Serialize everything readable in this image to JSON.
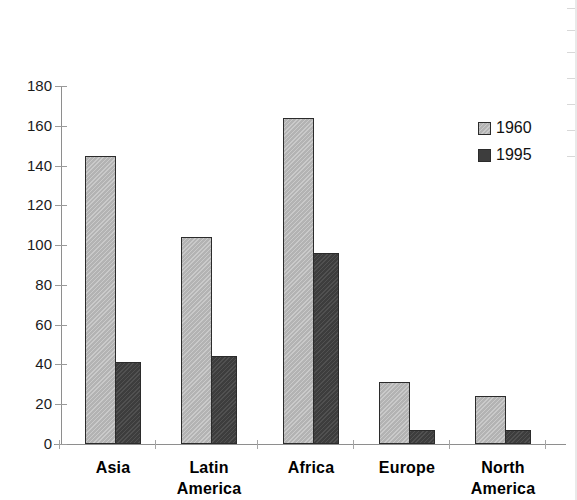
{
  "chart_data": {
    "type": "bar",
    "title": "",
    "subtitle": "",
    "xlabel": "",
    "ylabel": "",
    "categories": [
      "Asia",
      "Latin America",
      "Africa",
      "Europe",
      "North America"
    ],
    "category_lines": [
      [
        "Asia"
      ],
      [
        "Latin",
        "America"
      ],
      [
        "Africa"
      ],
      [
        "Europe"
      ],
      [
        "North",
        "America"
      ]
    ],
    "series": [
      {
        "name": "1960",
        "values": [
          145,
          104,
          164,
          31,
          24
        ],
        "color": "#b3b3b3"
      },
      {
        "name": "1995",
        "values": [
          41,
          44,
          96,
          7,
          7
        ],
        "color": "#3d3d3d"
      }
    ],
    "ylim": [
      0,
      180
    ],
    "ytick_step": 20,
    "ytick_labels": [
      "180",
      "160",
      "140",
      "120",
      "100",
      "80",
      "60",
      "40",
      "20",
      "0"
    ],
    "grid": false,
    "legend_position": "right-top",
    "legend_entries": [
      "1960",
      "1995"
    ]
  }
}
